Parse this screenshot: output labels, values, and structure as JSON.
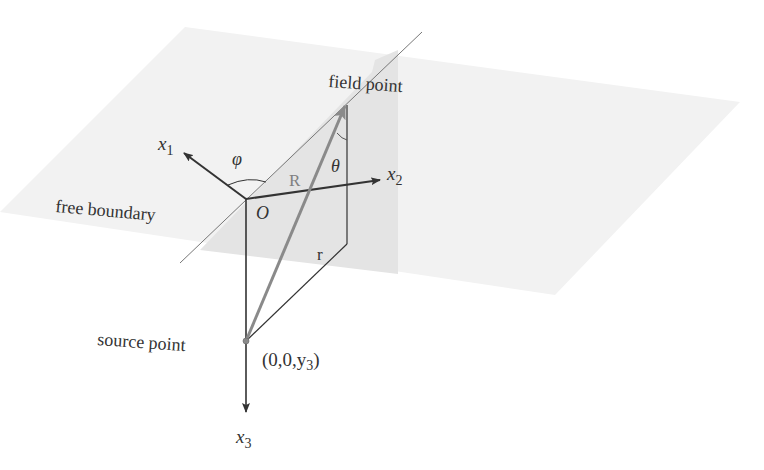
{
  "figure": {
    "type": "3D geometry diagram",
    "colors": {
      "background": "#ffffff",
      "horizontal_plane": "#f2f2f2",
      "vertical_plane": "#e4e4e4",
      "axis": "#333333",
      "R_vector": "#8a8a8a",
      "boundary_line": "#777777"
    }
  },
  "labels": {
    "field_point": "field point",
    "free_boundary": "free boundary",
    "source_point": "source point",
    "source_coords": "(0,0,y",
    "source_coords_sub": "3",
    "source_coords_close": ")",
    "origin": "O",
    "R": "R",
    "r": "r",
    "phi": "φ",
    "theta": "θ",
    "x1": "x",
    "x1_sub": "1",
    "x2": "x",
    "x2_sub": "2",
    "x3": "x",
    "x3_sub": "3"
  }
}
